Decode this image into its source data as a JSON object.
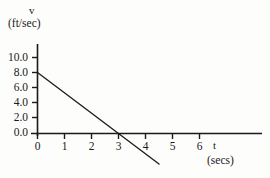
{
  "chart_data": {
    "type": "line",
    "title": "",
    "subtitle": "",
    "xlabel": "t",
    "xlabel_units": "(secs)",
    "ylabel": "v",
    "ylabel_units": "(ft/sec)",
    "xlim": [
      0,
      7.0
    ],
    "ylim": [
      -5.0,
      11.5
    ],
    "xticks": [
      0,
      1,
      2,
      3,
      4,
      5,
      6
    ],
    "xticklabels": [
      "0",
      "1",
      "2",
      "3",
      "4",
      "5",
      "6"
    ],
    "yticks": [
      0.0,
      2.0,
      4.0,
      6.0,
      8.0,
      10.0
    ],
    "yticklabels": [
      "0.0",
      "2.0",
      "4.0",
      "6.0",
      "8.0",
      "10.0"
    ],
    "grid": false,
    "legend": null,
    "series": [
      {
        "name": "velocity",
        "x": [
          0.0,
          4.5
        ],
        "y": [
          8.0,
          -4.0
        ],
        "intercept": 8.0,
        "slope": -2.6667,
        "x_intercept": 3.0,
        "color": "#1a1a1a",
        "linewidth": 1.3
      }
    ],
    "annotations": [],
    "axis_color": "#1a1a1a",
    "background_color": "#fdfdfc"
  }
}
